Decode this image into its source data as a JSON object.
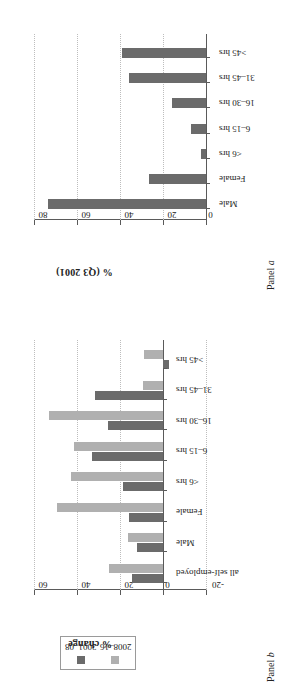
{
  "figure": {
    "panel_b_tag_prefix": "Panel ",
    "panel_b_tag_letter": "b",
    "panel_a_tag_prefix": "Panel ",
    "panel_a_tag_letter": "a"
  },
  "legend": {
    "position": "top-left",
    "entries": [
      {
        "label": "2001–08",
        "color": "#6b6b6b"
      },
      {
        "label": "2008–16",
        "color": "#b0b0b0"
      }
    ]
  },
  "chart_data": [
    {
      "id": "panel-b",
      "type": "bar",
      "title": "Panel b",
      "xlabel": "",
      "ylabel": "% change",
      "ylim": [
        -20,
        60
      ],
      "yticks": [
        -20,
        0,
        20,
        40,
        60
      ],
      "ytick_labels": [
        "-20",
        "0",
        "20",
        "40",
        "60"
      ],
      "grid": true,
      "categories": [
        "all self-employed",
        "Male",
        "Female",
        "<6 hrs",
        "6–15 hrs",
        "16–30 hrs",
        "31–45 hrs",
        ">45 hrs"
      ],
      "series": [
        {
          "name": "2001–08",
          "color": "#6b6b6b",
          "values": [
            14.5,
            12.0,
            16.0,
            18.8,
            33.0,
            25.5,
            31.6,
            -3.0
          ]
        },
        {
          "name": "2008–16",
          "color": "#b0b0b0",
          "values": [
            25.0,
            16.2,
            49.5,
            42.8,
            41.2,
            53.2,
            9.3,
            8.8
          ]
        }
      ]
    },
    {
      "id": "panel-a",
      "type": "bar",
      "title": "Panel a",
      "xlabel": "",
      "ylabel": "% (Q3 2001)",
      "ylim": [
        0,
        80
      ],
      "yticks": [
        0,
        20,
        40,
        60,
        80
      ],
      "ytick_labels": [
        "0",
        "20",
        "40",
        "60",
        "80"
      ],
      "grid": true,
      "categories": [
        "Male",
        "Female",
        "<6 hrs",
        "6–15 hrs",
        "16–30 hrs",
        "31–45 hrs",
        ">45 hrs"
      ],
      "series": [
        {
          "name": "Q3 2001 share",
          "color": "#6b6b6b",
          "values": [
            73.5,
            26.5,
            2.5,
            7.0,
            16.0,
            36.0,
            39.3
          ]
        }
      ]
    }
  ]
}
